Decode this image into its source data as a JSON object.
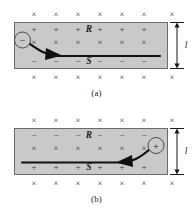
{
  "figure": {
    "panels": [
      {
        "id": "a",
        "caption": "(a)",
        "slab": {
          "fill_color": "#c9c9c9",
          "border_color": "#6b6b6b",
          "top_edge_charge_sign": "+",
          "bottom_edge_charge_sign": "−",
          "top_edge_label": "R",
          "bottom_edge_label": "S",
          "top_edge_charge_count": 6,
          "bottom_edge_charge_count": 6,
          "interior_field_symbol": "×",
          "interior_field_count": 6
        },
        "carrier": {
          "sign": "−",
          "label": "negative charge carrier",
          "position": "left"
        },
        "arrow": {
          "label": "drift velocity arrow",
          "direction": "rightward"
        },
        "field_symbol": "×",
        "field_rows": [
          {
            "name": "above-slab",
            "count": 7
          },
          {
            "name": "below-slab",
            "count": 7
          }
        ],
        "dimension": {
          "label": "l",
          "orientation": "vertical",
          "side": "right"
        }
      },
      {
        "id": "b",
        "caption": "(b)",
        "slab": {
          "fill_color": "#c9c9c9",
          "border_color": "#6b6b6b",
          "top_edge_charge_sign": "−",
          "bottom_edge_charge_sign": "+",
          "top_edge_label": "R",
          "bottom_edge_label": "S",
          "top_edge_charge_count": 6,
          "bottom_edge_charge_count": 6,
          "interior_field_symbol": "×",
          "interior_field_count": 6
        },
        "carrier": {
          "sign": "+",
          "label": "positive charge carrier",
          "position": "right"
        },
        "arrow": {
          "label": "drift velocity arrow",
          "direction": "leftward"
        },
        "field_symbol": "×",
        "field_rows": [
          {
            "name": "above-slab",
            "count": 7
          },
          {
            "name": "below-slab",
            "count": 7
          }
        ],
        "dimension": {
          "label": "l",
          "orientation": "vertical",
          "side": "right"
        }
      }
    ]
  },
  "colors": {
    "ink": "#1b1b1b",
    "slab_fill": "#c9c9c9",
    "slab_border": "#6b6b6b",
    "symbol": "#2a2a2a",
    "page_background": "#ffffff"
  },
  "labels": {
    "field_symbol": "×",
    "plus": "+",
    "minus": "−",
    "R": "R",
    "S": "S",
    "length": "l",
    "caption_a": "(a)",
    "caption_b": "(b)"
  }
}
